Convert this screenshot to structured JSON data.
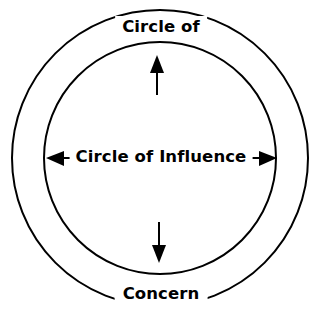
{
  "diagram": {
    "type": "concentric-circles",
    "title_top": "Circle of",
    "title_bottom": "Concern",
    "inner_label": "Circle of Influence",
    "colors": {
      "stroke": "#000000",
      "background": "#ffffff",
      "text": "#000000"
    },
    "outer_circle": {
      "name": "Circle of Concern",
      "center_x": 160,
      "center_y": 158,
      "radius": 148,
      "stroke_width": 2
    },
    "inner_circle": {
      "name": "Circle of Influence",
      "center_x": 160,
      "center_y": 158,
      "radius": 116,
      "stroke_width": 2
    },
    "arrows": [
      {
        "name": "arrow-up",
        "direction": "up",
        "from_x": 157,
        "from_y": 95,
        "to_x": 157,
        "to_y": 57
      },
      {
        "name": "arrow-down",
        "direction": "down",
        "from_x": 159,
        "from_y": 222,
        "to_x": 159,
        "to_y": 262
      },
      {
        "name": "arrow-left",
        "direction": "left",
        "from_x": 88,
        "from_y": 158,
        "to_x": 47,
        "to_y": 158
      },
      {
        "name": "arrow-right",
        "direction": "right",
        "from_x": 232,
        "from_y": 158,
        "to_x": 277,
        "to_y": 158
      }
    ]
  }
}
